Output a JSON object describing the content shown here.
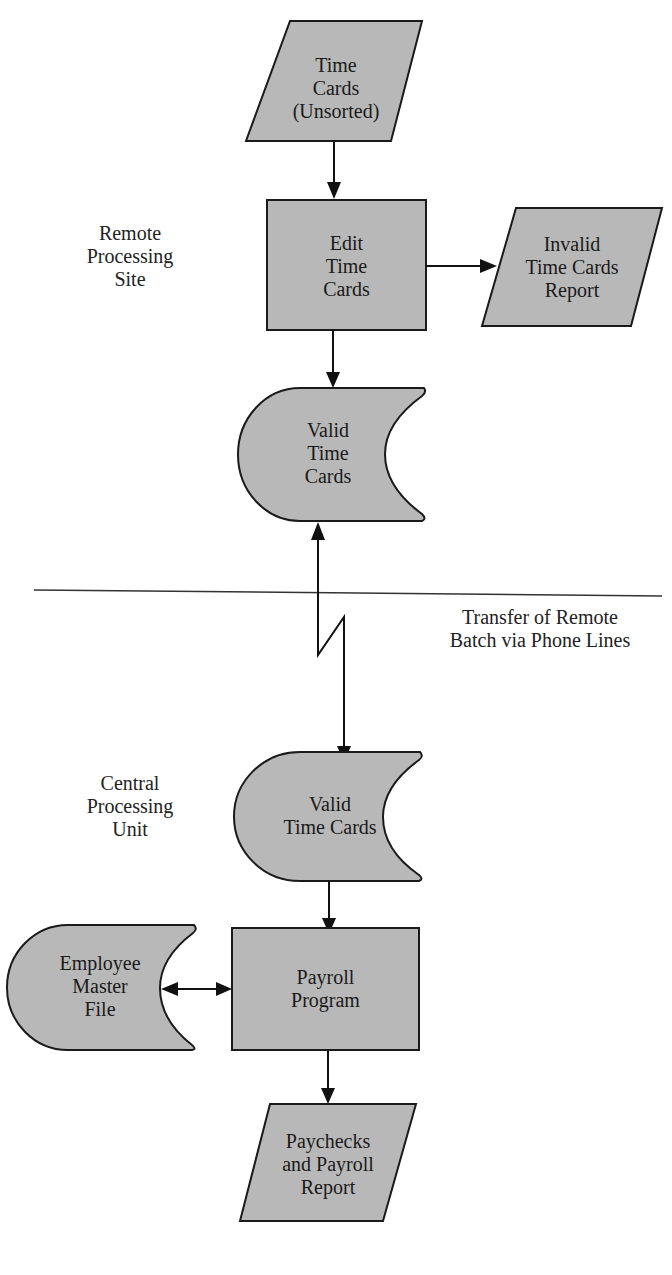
{
  "colors": {
    "shape_fill": "#b8b8b8",
    "stroke": "#1a1a1a",
    "background": "#ffffff"
  },
  "regions": {
    "remote": "Remote\nProcessing\nSite",
    "central": "Central\nProcessing\nUnit",
    "transfer": "Transfer of Remote\nBatch via Phone Lines"
  },
  "nodes": {
    "time_cards_unsorted": {
      "shape": "parallelogram",
      "label": "Time\nCards\n(Unsorted)"
    },
    "edit_time_cards": {
      "shape": "rectangle",
      "label": "Edit\nTime\nCards"
    },
    "invalid_report": {
      "shape": "parallelogram",
      "label": "Invalid\nTime Cards\nReport"
    },
    "valid_time_cards_remote": {
      "shape": "stored-data",
      "label": "Valid\nTime\nCards"
    },
    "valid_time_cards_central": {
      "shape": "stored-data",
      "label": "Valid\nTime Cards"
    },
    "employee_master_file": {
      "shape": "stored-data",
      "label": "Employee\nMaster\nFile"
    },
    "payroll_program": {
      "shape": "rectangle",
      "label": "Payroll\nProgram"
    },
    "paychecks_report": {
      "shape": "parallelogram",
      "label": "Paychecks\nand Payroll\nReport"
    }
  },
  "edges": [
    {
      "from": "time_cards_unsorted",
      "to": "edit_time_cards",
      "type": "arrow"
    },
    {
      "from": "edit_time_cards",
      "to": "invalid_report",
      "type": "arrow"
    },
    {
      "from": "edit_time_cards",
      "to": "valid_time_cards_remote",
      "type": "arrow"
    },
    {
      "from": "valid_time_cards_remote",
      "to": "valid_time_cards_central",
      "type": "communication-link"
    },
    {
      "from": "valid_time_cards_central",
      "to": "payroll_program",
      "type": "arrow"
    },
    {
      "from": "payroll_program",
      "to": "employee_master_file",
      "type": "bidirectional"
    },
    {
      "from": "payroll_program",
      "to": "paychecks_report",
      "type": "arrow"
    }
  ]
}
